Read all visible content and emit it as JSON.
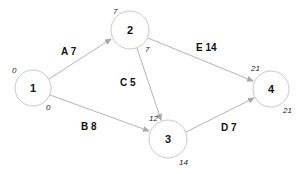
{
  "diagram": {
    "type": "activity-on-arrow network",
    "nodes": [
      {
        "id": "1",
        "label": "1",
        "cx": 33,
        "cy": 88,
        "r": 18,
        "early": "0",
        "late": "0"
      },
      {
        "id": "2",
        "label": "2",
        "cx": 130,
        "cy": 30,
        "r": 19,
        "early": "7",
        "late": "7"
      },
      {
        "id": "3",
        "label": "3",
        "cx": 168,
        "cy": 139,
        "r": 19,
        "early": "12",
        "late": "14"
      },
      {
        "id": "4",
        "label": "4",
        "cx": 271,
        "cy": 89,
        "r": 18,
        "early": "21",
        "late": "21"
      }
    ],
    "edges": [
      {
        "from": "1",
        "to": "2",
        "activity": "A",
        "duration": "7",
        "label": "A 7"
      },
      {
        "from": "1",
        "to": "3",
        "activity": "B",
        "duration": "8",
        "label": "B 8"
      },
      {
        "from": "2",
        "to": "3",
        "activity": "C",
        "duration": "5",
        "label": "C 5"
      },
      {
        "from": "3",
        "to": "4",
        "activity": "D",
        "duration": "7",
        "label": "D 7"
      },
      {
        "from": "2",
        "to": "4",
        "activity": "E",
        "duration": "14",
        "label": "E 14"
      }
    ]
  },
  "colors": {
    "node_stroke": "#c8c8c8",
    "edge_stroke": "#b4b4b4",
    "text": "#111111",
    "background": "#ffffff"
  }
}
